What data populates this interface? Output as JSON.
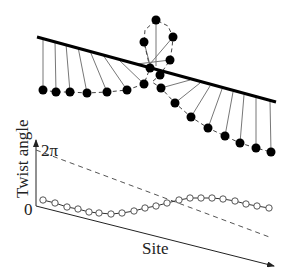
{
  "diagram": {
    "top": {
      "description": "Spin chain with rod; pendulums hanging from a tilted bar",
      "bar": {
        "x1": 37,
        "y1": 37,
        "x2": 276,
        "y2": 102,
        "color": "#000000",
        "width": 3
      },
      "pendulums": [
        {
          "ax": 43,
          "ay": 38,
          "bx": 43,
          "by": 90
        },
        {
          "ax": 55,
          "ay": 41,
          "bx": 56,
          "by": 92
        },
        {
          "ax": 66,
          "ay": 44,
          "bx": 70,
          "by": 92
        },
        {
          "ax": 78,
          "ay": 47,
          "bx": 87,
          "by": 93
        },
        {
          "ax": 90,
          "ay": 51,
          "bx": 107,
          "by": 92
        },
        {
          "ax": 103,
          "ay": 55,
          "bx": 127,
          "by": 90
        },
        {
          "ax": 118,
          "ay": 59,
          "bx": 144,
          "by": 84
        },
        {
          "ax": 133,
          "ay": 63,
          "bx": 150,
          "by": 68
        },
        {
          "ax": 150,
          "ay": 65,
          "bx": 144,
          "by": 42
        },
        {
          "ax": 156,
          "ay": 66,
          "bx": 156,
          "by": 20
        },
        {
          "ax": 150,
          "ay": 64,
          "bx": 173,
          "by": 37
        },
        {
          "ax": 137,
          "ay": 64,
          "bx": 170,
          "by": 60
        },
        {
          "ax": 160,
          "ay": 75,
          "bx": 160,
          "by": 75
        },
        {
          "ax": 190,
          "ay": 80,
          "bx": 161,
          "by": 88
        },
        {
          "ax": 200,
          "ay": 83,
          "bx": 175,
          "by": 103
        },
        {
          "ax": 210,
          "ay": 86,
          "bx": 191,
          "by": 117
        },
        {
          "ax": 222,
          "ay": 89,
          "bx": 208,
          "by": 128
        },
        {
          "ax": 233,
          "ay": 92,
          "bx": 225,
          "by": 136
        },
        {
          "ax": 244,
          "ay": 95,
          "bx": 240,
          "by": 143
        },
        {
          "ax": 256,
          "ay": 98,
          "bx": 256,
          "by": 148
        },
        {
          "ax": 270,
          "ay": 101,
          "bx": 271,
          "by": 152
        }
      ],
      "dashed_path": [
        [
          43,
          90
        ],
        [
          56,
          92
        ],
        [
          70,
          92
        ],
        [
          87,
          93
        ],
        [
          107,
          92
        ],
        [
          127,
          90
        ],
        [
          144,
          84
        ],
        [
          150,
          68
        ],
        [
          144,
          42
        ],
        [
          145,
          30
        ],
        [
          156,
          20
        ],
        [
          168,
          26
        ],
        [
          173,
          37
        ],
        [
          172,
          48
        ],
        [
          170,
          60
        ],
        [
          160,
          75
        ],
        [
          152,
          82
        ],
        [
          161,
          88
        ],
        [
          175,
          103
        ],
        [
          191,
          117
        ],
        [
          208,
          128
        ],
        [
          225,
          136
        ],
        [
          240,
          143
        ],
        [
          256,
          148
        ],
        [
          271,
          152
        ]
      ],
      "dot_color": "#000000",
      "dot_radius": 4.5
    },
    "bottom": {
      "y_axis_label": "Twist angle",
      "x_axis_label": "Site",
      "tick_top": "2π",
      "tick_zero": "0",
      "origin": [
        36,
        206
      ],
      "y_axis_top": [
        36,
        140
      ],
      "x_axis_end": [
        274,
        266
      ],
      "dashed_line": [
        [
          36,
          150
        ],
        [
          272,
          238
        ]
      ],
      "curve_points": [
        [
          43,
          200
        ],
        [
          55,
          203
        ],
        [
          67,
          207
        ],
        [
          78,
          209
        ],
        [
          89,
          212
        ],
        [
          99,
          213
        ],
        [
          111,
          214
        ],
        [
          122,
          213
        ],
        [
          134,
          211
        ],
        [
          145,
          208
        ],
        [
          156,
          206
        ],
        [
          167,
          203
        ],
        [
          179,
          200
        ],
        [
          190,
          198
        ],
        [
          201,
          198
        ],
        [
          212,
          198
        ],
        [
          223,
          199
        ],
        [
          235,
          201
        ],
        [
          246,
          204
        ],
        [
          257,
          206
        ],
        [
          269,
          208
        ]
      ],
      "circle_radius": 3.2,
      "circle_color": "#555555"
    }
  }
}
